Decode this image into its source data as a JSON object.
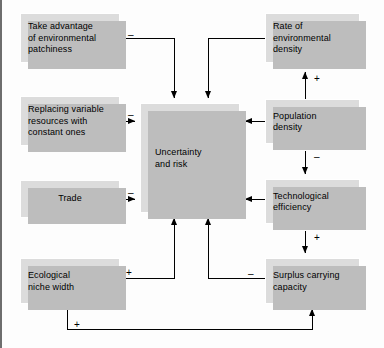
{
  "diagram": {
    "type": "causal-loop-diagram",
    "background_color": "#fdfdfd",
    "node_fill_color": "#dcdcdc",
    "node_shadow_color": "#bdbdbd",
    "edge_color": "#000000",
    "nodes": [
      {
        "id": "take-advantage",
        "label": "Take advantage\nof environmental\npatchiness",
        "x": 20,
        "y": 13,
        "w": 100,
        "h": 50,
        "align": "left"
      },
      {
        "id": "replacing-variable",
        "label": "Replacing variable\nresources with\nconstant ones",
        "x": 20,
        "y": 96,
        "w": 100,
        "h": 50,
        "align": "left"
      },
      {
        "id": "trade",
        "label": "Trade",
        "x": 20,
        "y": 180,
        "w": 100,
        "h": 38,
        "align": "center"
      },
      {
        "id": "ecological-niche-width",
        "label": "Ecological\nniche width",
        "x": 20,
        "y": 258,
        "w": 100,
        "h": 46,
        "align": "left"
      },
      {
        "id": "uncertainty-and-risk",
        "label": "Uncertainty\nand risk",
        "x": 140,
        "y": 103,
        "w": 100,
        "h": 110,
        "align": "left"
      },
      {
        "id": "rate-of-environmental-density",
        "label": "Rate of\nenvironmental\ndensity",
        "x": 265,
        "y": 13,
        "w": 95,
        "h": 50,
        "align": "left"
      },
      {
        "id": "population-density",
        "label": "Population\ndensity",
        "x": 265,
        "y": 99,
        "w": 95,
        "h": 45,
        "align": "left"
      },
      {
        "id": "technological-efficiency",
        "label": "Technological\nefficiency",
        "x": 265,
        "y": 179,
        "w": 95,
        "h": 45,
        "align": "left"
      },
      {
        "id": "surplus-carrying-capacity",
        "label": "Surplus carrying\ncapacity",
        "x": 265,
        "y": 258,
        "w": 95,
        "h": 46,
        "align": "left"
      }
    ],
    "edges": [
      {
        "id": "take-advantage-to-uncertainty",
        "from": "take-advantage",
        "to": "uncertainty-and-risk",
        "sign": "–",
        "sign_x": 128,
        "sign_y": 30
      },
      {
        "id": "rate-of-environmental-density-to-uncertainty",
        "from": "rate-of-environmental-density",
        "to": "uncertainty-and-risk",
        "sign": "",
        "sign_x": 0,
        "sign_y": 0
      },
      {
        "id": "replacing-variable-to-uncertainty",
        "from": "replacing-variable",
        "to": "uncertainty-and-risk",
        "sign": "–",
        "sign_x": 128,
        "sign_y": 110
      },
      {
        "id": "trade-to-uncertainty",
        "from": "trade",
        "to": "uncertainty-and-risk",
        "sign": "–",
        "sign_x": 128,
        "sign_y": 190
      },
      {
        "id": "population-density-to-uncertainty",
        "from": "population-density",
        "to": "uncertainty-and-risk",
        "sign": "",
        "sign_x": 0,
        "sign_y": 0
      },
      {
        "id": "technological-efficiency-to-uncertainty",
        "from": "technological-efficiency",
        "to": "uncertainty-and-risk",
        "sign": "",
        "sign_x": 0,
        "sign_y": 0
      },
      {
        "id": "population-density-to-rate-of-environmental-density",
        "from": "population-density",
        "to": "rate-of-environmental-density",
        "sign": "+",
        "sign_x": 318,
        "sign_y": 74
      },
      {
        "id": "population-density-to-technological-efficiency",
        "from": "population-density",
        "to": "technological-efficiency",
        "sign": "–",
        "sign_x": 318,
        "sign_y": 152
      },
      {
        "id": "technological-efficiency-to-surplus-carrying-capacity",
        "from": "technological-efficiency",
        "to": "surplus-carrying-capacity",
        "sign": "+",
        "sign_x": 318,
        "sign_y": 232
      },
      {
        "id": "ecological-niche-width-to-uncertainty",
        "from": "ecological-niche-width",
        "to": "uncertainty-and-risk",
        "sign": "+",
        "sign_x": 127,
        "sign_y": 268
      },
      {
        "id": "surplus-carrying-capacity-to-uncertainty",
        "from": "surplus-carrying-capacity",
        "to": "uncertainty-and-risk",
        "sign": "–",
        "sign_x": 249,
        "sign_y": 268
      },
      {
        "id": "ecological-niche-width-to-surplus-carrying-capacity",
        "from": "ecological-niche-width",
        "to": "surplus-carrying-capacity",
        "sign": "+",
        "sign_x": 76,
        "sign_y": 322
      }
    ]
  }
}
